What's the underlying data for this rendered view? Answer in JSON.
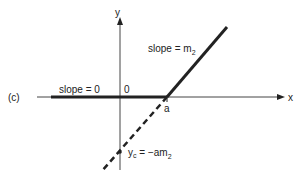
{
  "diagram": {
    "panel_label": "(c)",
    "axes": {
      "x_label": "x",
      "y_label": "y",
      "origin_label": "0"
    },
    "labels": {
      "slope_left": "slope = 0",
      "slope_right_prefix": "slope = m",
      "slope_right_sub": "2",
      "point_a": "a",
      "intercept_y": "y",
      "intercept_y_sub": "c",
      "intercept_eq": " = −am",
      "intercept_eq_sub": "2"
    },
    "colors": {
      "line": "#222222",
      "axis": "#333333",
      "background": "#ffffff"
    }
  }
}
